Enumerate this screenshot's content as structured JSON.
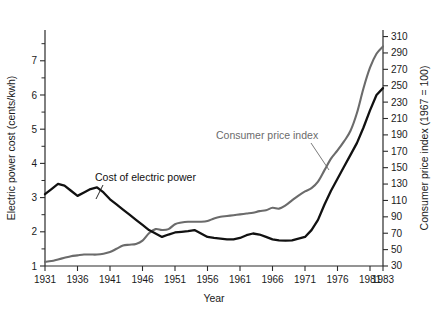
{
  "chart_data": {
    "type": "line",
    "title": "",
    "xlabel": "Year",
    "x_ticks": [
      1931,
      1936,
      1941,
      1946,
      1951,
      1956,
      1961,
      1966,
      1971,
      1976,
      1981,
      1983
    ],
    "xlim": [
      1931,
      1983
    ],
    "grid": false,
    "legend_position": "inline-annotations",
    "axes": [
      {
        "id": "left",
        "label": "Electric power cost (cents/kwh)",
        "ticks": [
          1,
          2,
          3,
          4,
          5,
          6,
          7
        ],
        "minor_ticks": [
          1.5,
          2.5,
          3.5,
          4.5,
          5.5,
          6.5,
          7.5
        ],
        "lim": [
          1,
          7.9
        ],
        "units": "cents/kwh"
      },
      {
        "id": "right",
        "label": "Consumer price index (1967 = 100)",
        "ticks": [
          30,
          50,
          70,
          90,
          110,
          130,
          150,
          170,
          190,
          210,
          230,
          250,
          270,
          290,
          310
        ],
        "lim": [
          30,
          318
        ],
        "units": "index"
      }
    ],
    "series": [
      {
        "name": "Cost of electric power",
        "axis": "left",
        "color": "#111111",
        "annotation": "Cost of electric power",
        "x": [
          1931,
          1932,
          1933,
          1934,
          1935,
          1936,
          1937,
          1938,
          1939,
          1940,
          1941,
          1942,
          1943,
          1944,
          1945,
          1946,
          1947,
          1948,
          1949,
          1950,
          1951,
          1952,
          1953,
          1954,
          1955,
          1956,
          1957,
          1958,
          1959,
          1960,
          1961,
          1962,
          1963,
          1964,
          1965,
          1966,
          1967,
          1968,
          1969,
          1970,
          1971,
          1972,
          1973,
          1974,
          1975,
          1976,
          1977,
          1978,
          1979,
          1980,
          1981,
          1982,
          1983
        ],
        "values": [
          3.1,
          3.25,
          3.4,
          3.35,
          3.2,
          3.05,
          3.15,
          3.25,
          3.3,
          3.15,
          2.95,
          2.8,
          2.65,
          2.5,
          2.35,
          2.2,
          2.05,
          1.95,
          1.85,
          1.92,
          1.98,
          2.0,
          2.02,
          2.05,
          1.95,
          1.85,
          1.82,
          1.8,
          1.78,
          1.78,
          1.82,
          1.9,
          1.95,
          1.92,
          1.85,
          1.78,
          1.75,
          1.74,
          1.75,
          1.8,
          1.85,
          2.05,
          2.35,
          2.8,
          3.2,
          3.55,
          3.9,
          4.25,
          4.6,
          5.05,
          5.55,
          6.0,
          6.2
        ]
      },
      {
        "name": "Consumer price index",
        "axis": "right",
        "color": "#6b6b6b",
        "annotation": "Consumer price index",
        "x": [
          1931,
          1932,
          1933,
          1934,
          1935,
          1936,
          1937,
          1938,
          1939,
          1940,
          1941,
          1942,
          1943,
          1944,
          1945,
          1946,
          1947,
          1948,
          1949,
          1950,
          1951,
          1952,
          1953,
          1954,
          1955,
          1956,
          1957,
          1958,
          1959,
          1960,
          1961,
          1962,
          1963,
          1964,
          1965,
          1966,
          1967,
          1968,
          1969,
          1970,
          1971,
          1972,
          1973,
          1974,
          1975,
          1976,
          1977,
          1978,
          1979,
          1980,
          1981,
          1982,
          1983
        ],
        "values": [
          35,
          36,
          38,
          40,
          42,
          43,
          44,
          44,
          44,
          45,
          47,
          51,
          55,
          56,
          57,
          61,
          70,
          75,
          74,
          75,
          81,
          83,
          84,
          84,
          84,
          85,
          88,
          90,
          91,
          92,
          93,
          94,
          95,
          97,
          98,
          101,
          100,
          104,
          110,
          116,
          121,
          125,
          133,
          147,
          161,
          171,
          182,
          195,
          217,
          247,
          272,
          289,
          298
        ]
      }
    ],
    "annotations": [
      {
        "id": "cost-annotation",
        "text": "Cost of electric power",
        "color": "#111111"
      },
      {
        "id": "cpi-annotation",
        "text": "Consumer price index",
        "color": "#6b6b6b"
      }
    ]
  }
}
